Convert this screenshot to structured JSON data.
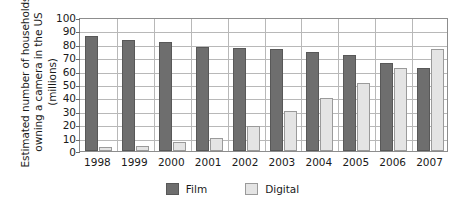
{
  "chart_data": {
    "type": "bar",
    "title": "",
    "subtitle": "",
    "xlabel": "",
    "ylabel": "Estimated number of households owning a camera in the US (millions)",
    "ylabel_lines": [
      "Estimated number of households",
      "owning a camera in the US",
      "(millions)"
    ],
    "categories": [
      "1998",
      "1999",
      "2000",
      "2001",
      "2002",
      "2003",
      "2004",
      "2005",
      "2006",
      "2007"
    ],
    "series": [
      {
        "name": "Film",
        "color": "#6e6e6e",
        "values": [
          86,
          83,
          81,
          77.5,
          77,
          76,
          74,
          72,
          65.5,
          62
        ]
      },
      {
        "name": "Digital",
        "color": "#e4e4e4",
        "values": [
          3,
          4,
          6.5,
          10,
          18.5,
          29.5,
          39.5,
          51,
          62,
          76.5
        ]
      }
    ],
    "ylim": [
      0,
      100
    ],
    "ytick_step": 10,
    "yticks": [
      100,
      90,
      80,
      70,
      60,
      50,
      40,
      30,
      20,
      10,
      0
    ],
    "grid": true,
    "legend_position": "bottom",
    "legend_entries": [
      "Film",
      "Digital"
    ]
  },
  "colors": {
    "film": "#6e6e6e",
    "film_border": "#585858",
    "digital": "#e4e4e4",
    "digital_border": "#9a9a9a",
    "gridline": "#b8b8b8",
    "plot_border": "#8d8d8d",
    "text": "#1a1a1a",
    "background": "#ffffff"
  }
}
